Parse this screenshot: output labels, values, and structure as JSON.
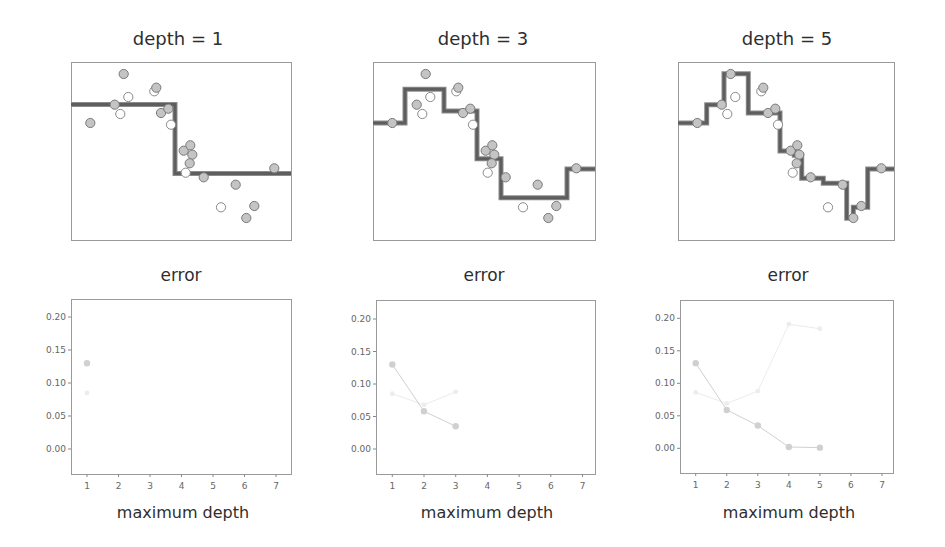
{
  "figure": {
    "top_row_titles": [
      "depth = 1",
      "depth = 3",
      "depth = 5"
    ],
    "bottom_row_titles": [
      "error",
      "error",
      "error"
    ],
    "bottom_row_xlabels": [
      "maximum depth",
      "maximum depth",
      "maximum depth"
    ]
  },
  "colors": {
    "train_point_fill": "#c4c4c4",
    "train_point_stroke": "#7a7a7a",
    "test_point_fill": "#ffffff",
    "test_point_stroke": "#8a8a8a",
    "step_line": "#5e5e5e",
    "train_error": "#d0d0d0",
    "test_error": "#ececec"
  },
  "chart_data": [
    {
      "type": "scatter",
      "title": "depth = 1",
      "note": "coordinates in frame-relative pixels (x 0-220 left-to-right, y 0-178 top-to-bottom); axes unlabeled",
      "grid": false,
      "train_points": [
        [
          19.3,
          61
        ],
        [
          52.7,
          12
        ],
        [
          43.7,
          42.7
        ],
        [
          85.3,
          25.7
        ],
        [
          90,
          51
        ],
        [
          97.3,
          46.7
        ],
        [
          112.7,
          88.7
        ],
        [
          119.3,
          83.3
        ],
        [
          121.3,
          92.7
        ],
        [
          118.7,
          101.3
        ],
        [
          132.7,
          115.3
        ],
        [
          164.7,
          122.7
        ],
        [
          183.3,
          144
        ],
        [
          175.3,
          156
        ],
        [
          203.3,
          106.3
        ]
      ],
      "test_points": [
        [
          57.3,
          35
        ],
        [
          49.3,
          52
        ],
        [
          83.3,
          29.3
        ],
        [
          100,
          62.7
        ],
        [
          114.7,
          110.7
        ],
        [
          150,
          145.3
        ]
      ],
      "step_fit": [
        [
          0,
          42.5
        ],
        [
          104,
          42.5
        ],
        [
          104,
          111.5
        ],
        [
          220,
          111.5
        ]
      ]
    },
    {
      "type": "scatter",
      "title": "depth = 3",
      "grid": false,
      "train_points": [
        [
          19.3,
          61
        ],
        [
          52.7,
          12
        ],
        [
          43.7,
          42.7
        ],
        [
          85.3,
          25.7
        ],
        [
          90,
          51
        ],
        [
          97.3,
          46.7
        ],
        [
          112.7,
          88.7
        ],
        [
          119.3,
          83.3
        ],
        [
          121.3,
          92.7
        ],
        [
          118.7,
          101.3
        ],
        [
          132.7,
          115.3
        ],
        [
          164.7,
          122.7
        ],
        [
          183.3,
          144
        ],
        [
          175.3,
          156
        ],
        [
          203.3,
          106.3
        ]
      ],
      "test_points": [
        [
          57.3,
          35
        ],
        [
          49.3,
          52
        ],
        [
          83.3,
          29.3
        ],
        [
          100,
          62.7
        ],
        [
          114.7,
          110.7
        ],
        [
          150,
          145.3
        ]
      ],
      "step_fit": [
        [
          0,
          61
        ],
        [
          32,
          61
        ],
        [
          32,
          27.3
        ],
        [
          71,
          27.3
        ],
        [
          71,
          49
        ],
        [
          104,
          49
        ],
        [
          104,
          96.7
        ],
        [
          128,
          96.7
        ],
        [
          128,
          135.7
        ],
        [
          194,
          135.7
        ],
        [
          194,
          107
        ],
        [
          222,
          107
        ]
      ]
    },
    {
      "type": "scatter",
      "title": "depth = 5",
      "grid": false,
      "train_points": [
        [
          19.3,
          61
        ],
        [
          52.7,
          12
        ],
        [
          43.7,
          42.7
        ],
        [
          85.3,
          25.7
        ],
        [
          90,
          51
        ],
        [
          97.3,
          46.7
        ],
        [
          112.7,
          88.7
        ],
        [
          119.3,
          83.3
        ],
        [
          121.3,
          92.7
        ],
        [
          118.7,
          101.3
        ],
        [
          132.7,
          115.3
        ],
        [
          164.7,
          122.7
        ],
        [
          183.3,
          144
        ],
        [
          175.3,
          156
        ],
        [
          203.3,
          106.3
        ]
      ],
      "test_points": [
        [
          57.3,
          35
        ],
        [
          49.3,
          52
        ],
        [
          83.3,
          29.3
        ],
        [
          100,
          62.7
        ],
        [
          114.7,
          110.7
        ],
        [
          150,
          145.3
        ]
      ],
      "step_fit": [
        [
          0,
          61
        ],
        [
          28.7,
          61
        ],
        [
          28.7,
          42.7
        ],
        [
          46,
          42.7
        ],
        [
          46,
          11.7
        ],
        [
          70.3,
          11.7
        ],
        [
          70.3,
          51
        ],
        [
          102,
          51
        ],
        [
          102,
          89
        ],
        [
          116.3,
          89
        ],
        [
          116.3,
          93.3
        ],
        [
          123.7,
          93.3
        ],
        [
          123.7,
          116.3
        ],
        [
          145.3,
          116.3
        ],
        [
          145.3,
          121.3
        ],
        [
          168.7,
          121.3
        ],
        [
          168.7,
          156.3
        ],
        [
          175.3,
          156.3
        ],
        [
          175.3,
          145.3
        ],
        [
          189.7,
          145.3
        ],
        [
          189.7,
          107
        ],
        [
          216,
          107
        ]
      ]
    },
    {
      "type": "line",
      "title": "error",
      "xlabel": "maximum depth",
      "ylabel": "",
      "xlim": [
        0.5,
        7.5
      ],
      "ylim": [
        -0.038,
        0.225
      ],
      "x_ticks": [
        "1",
        "2",
        "3",
        "4",
        "5",
        "6",
        "7"
      ],
      "y_ticks": [
        "0.20",
        "0.15",
        "0.10",
        "0.05",
        "0.00"
      ],
      "grid": false,
      "series": [
        {
          "name": "train",
          "x": [
            1
          ],
          "values": [
            0.13
          ]
        },
        {
          "name": "test",
          "x": [
            1
          ],
          "values": [
            0.085
          ]
        }
      ]
    },
    {
      "type": "line",
      "title": "error",
      "xlabel": "maximum depth",
      "ylabel": "",
      "xlim": [
        0.5,
        7.5
      ],
      "ylim": [
        -0.038,
        0.225
      ],
      "x_ticks": [
        "1",
        "2",
        "3",
        "4",
        "5",
        "6",
        "7"
      ],
      "y_ticks": [
        "0.20",
        "0.15",
        "0.10",
        "0.05",
        "0.00"
      ],
      "grid": false,
      "series": [
        {
          "name": "train",
          "x": [
            1,
            2,
            3
          ],
          "values": [
            0.13,
            0.058,
            0.035
          ]
        },
        {
          "name": "test",
          "x": [
            1,
            2,
            3
          ],
          "values": [
            0.085,
            0.068,
            0.088
          ]
        }
      ]
    },
    {
      "type": "line",
      "title": "error",
      "xlabel": "maximum depth",
      "ylabel": "",
      "xlim": [
        0.5,
        7.5
      ],
      "ylim": [
        -0.038,
        0.225
      ],
      "x_ticks": [
        "1",
        "2",
        "3",
        "4",
        "5",
        "6",
        "7"
      ],
      "y_ticks": [
        "0.20",
        "0.15",
        "0.10",
        "0.05",
        "0.00"
      ],
      "grid": false,
      "series": [
        {
          "name": "train",
          "x": [
            1,
            2,
            3,
            4,
            5
          ],
          "values": [
            0.131,
            0.059,
            0.035,
            0.002,
            0.001
          ]
        },
        {
          "name": "test",
          "x": [
            1,
            2,
            3,
            4,
            5
          ],
          "values": [
            0.086,
            0.069,
            0.088,
            0.191,
            0.184
          ]
        }
      ]
    }
  ]
}
